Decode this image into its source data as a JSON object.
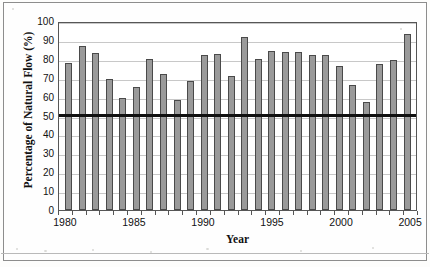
{
  "chart_data": {
    "type": "bar",
    "title": "",
    "xlabel": "Year",
    "ylabel": "Percentage of Natural Flow (%)",
    "ylim": [
      0,
      100
    ],
    "ytick_step": 10,
    "yticks": [
      100,
      90,
      80,
      70,
      60,
      50,
      40,
      30,
      20,
      10,
      0
    ],
    "grid": true,
    "legend": "none",
    "bar_color": "#9a9a9a",
    "bar_edge_color": "#4a4a4a",
    "categories": [
      "1980",
      "1981",
      "1982",
      "1983",
      "1984",
      "1985",
      "1986",
      "1987",
      "1988",
      "1989",
      "1990",
      "1991",
      "1992",
      "1993",
      "1994",
      "1995",
      "1996",
      "1997",
      "1998",
      "1999",
      "2000",
      "2001",
      "2002",
      "2003",
      "2004",
      "2005"
    ],
    "values": [
      78,
      87,
      83,
      69.5,
      59.5,
      65,
      80,
      72,
      58,
      68,
      82,
      82.5,
      71,
      91.5,
      80,
      84,
      83.5,
      83.5,
      82,
      82,
      76,
      66,
      57,
      77,
      79.5,
      93
    ],
    "xtick_labels": [
      "1980",
      "1985",
      "1990",
      "1995",
      "2000",
      "2005"
    ],
    "xtick_categories": [
      "1980",
      "1985",
      "1990",
      "1995",
      "2000",
      "2005"
    ],
    "reference_line": {
      "value": 50,
      "label": "",
      "color": "#101010",
      "width_px": 3
    }
  }
}
